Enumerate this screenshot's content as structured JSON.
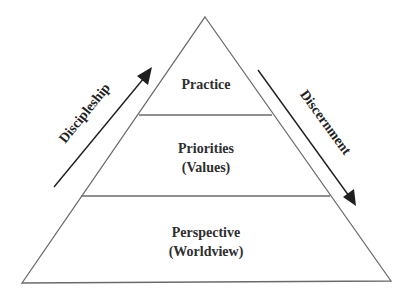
{
  "diagram": {
    "type": "pyramid",
    "levels": [
      {
        "id": "top",
        "lines": [
          "Practice"
        ]
      },
      {
        "id": "middle",
        "lines": [
          "Priorities",
          "(Values)"
        ]
      },
      {
        "id": "bottom",
        "lines": [
          "Perspective",
          "(Worldview)"
        ]
      }
    ],
    "arrows": {
      "left": {
        "label": "Discipleship",
        "direction": "up"
      },
      "right": {
        "label": "Discernment",
        "direction": "down"
      }
    },
    "colors": {
      "outline": "#6b6b6b",
      "arrow": "#1e1e1e",
      "text": "#2e2e2e"
    }
  }
}
